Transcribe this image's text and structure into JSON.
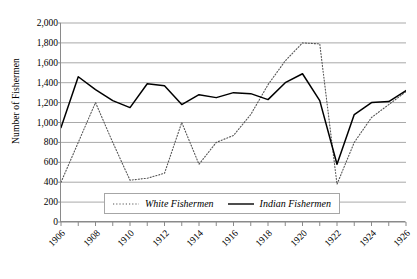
{
  "chart_data": {
    "type": "line",
    "title": "",
    "xlabel": "",
    "ylabel": "Number of Fishermen",
    "xlim": [
      1906,
      1926
    ],
    "ylim": [
      0,
      2000
    ],
    "grid": true,
    "legend_position": "bottom-center",
    "x": [
      1906,
      1907,
      1908,
      1909,
      1910,
      1911,
      1912,
      1913,
      1914,
      1915,
      1916,
      1917,
      1918,
      1919,
      1920,
      1921,
      1922,
      1923,
      1924,
      1925,
      1926
    ],
    "xtick_labels": [
      "1906",
      "1908",
      "1910",
      "1912",
      "1914",
      "1916",
      "1918",
      "1920",
      "1922",
      "1924",
      "1926"
    ],
    "xtick_values": [
      1906,
      1908,
      1910,
      1912,
      1914,
      1916,
      1918,
      1920,
      1922,
      1924,
      1926
    ],
    "ytick_labels": [
      "0",
      "200",
      "400",
      "600",
      "800",
      "1,000",
      "1,200",
      "1,400",
      "1,600",
      "1,800",
      "2,000"
    ],
    "ytick_values": [
      0,
      200,
      400,
      600,
      800,
      1000,
      1200,
      1400,
      1600,
      1800,
      2000
    ],
    "series": [
      {
        "name": "White Fishermen",
        "style": "dotted",
        "color": "#555555",
        "values": [
          400,
          800,
          1200,
          800,
          420,
          440,
          490,
          1000,
          580,
          800,
          870,
          1080,
          1380,
          1620,
          1800,
          1790,
          380,
          800,
          1050,
          1180,
          1310
        ]
      },
      {
        "name": "Indian Fishermen",
        "style": "solid",
        "color": "#000000",
        "values": [
          950,
          1460,
          1330,
          1220,
          1150,
          1390,
          1370,
          1180,
          1280,
          1250,
          1300,
          1290,
          1230,
          1400,
          1490,
          1220,
          580,
          1080,
          1200,
          1210,
          1320
        ]
      }
    ]
  },
  "legend": {
    "items": [
      {
        "label": "White Fishermen",
        "style": "dotted"
      },
      {
        "label": "Indian Fishermen",
        "style": "solid"
      }
    ]
  }
}
